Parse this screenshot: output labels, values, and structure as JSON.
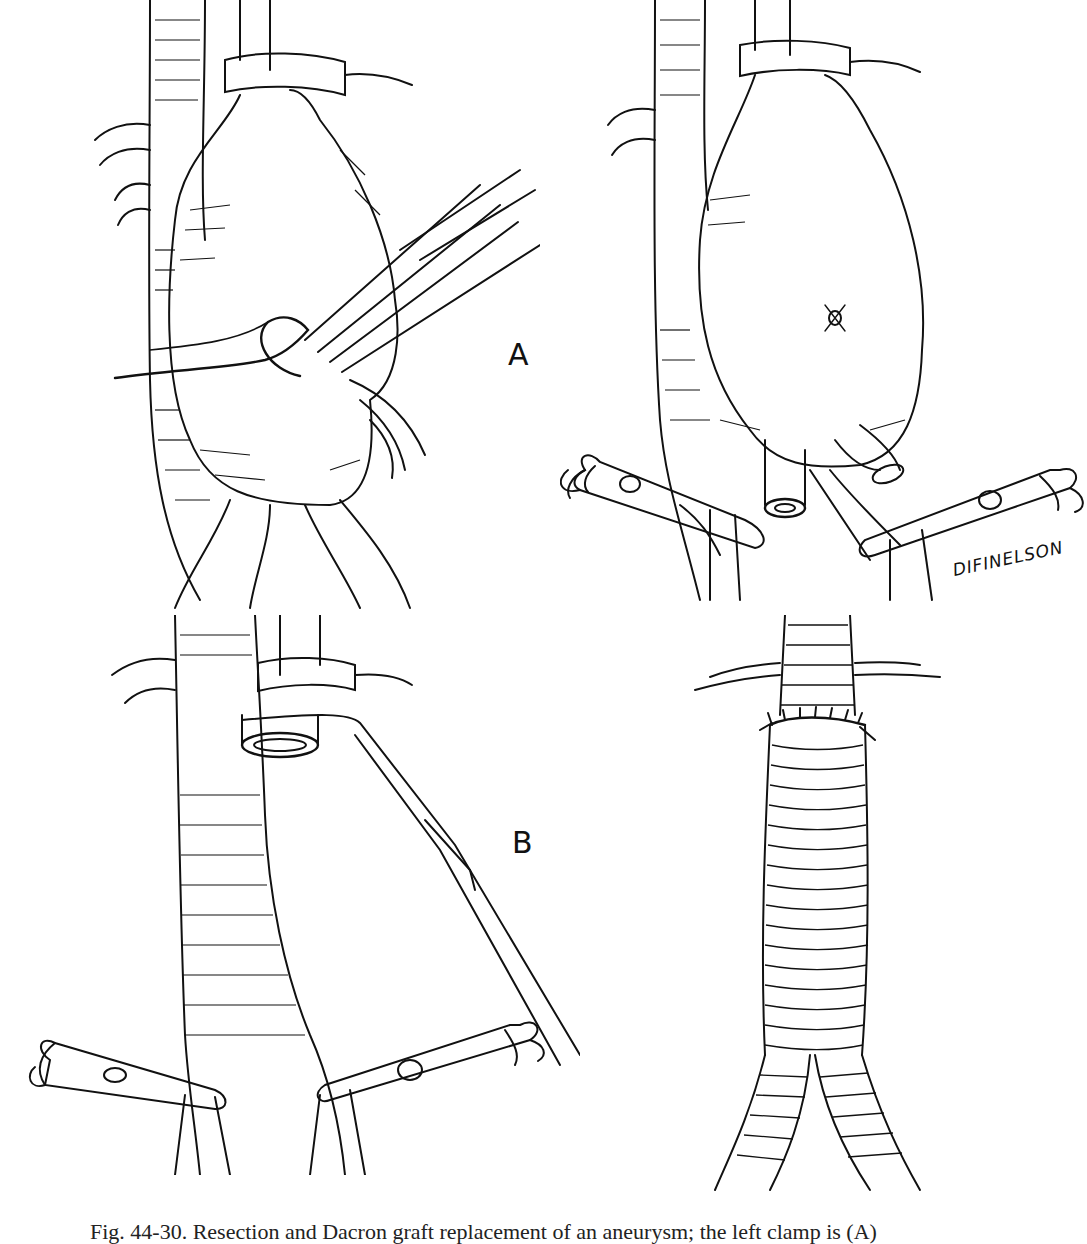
{
  "figure": {
    "ink_color": "#111111",
    "paper_color": "#ffffff",
    "panels": [
      {
        "id": "top-left",
        "title": "Aneurysm with ligature and retracted tissue"
      },
      {
        "id": "top-right",
        "title": "Aneurysm with iliac clamps applied"
      },
      {
        "id": "bottom-left",
        "title": "Aorta cross-clamped, aneurysm excised"
      },
      {
        "id": "bottom-right",
        "title": "Bifurcated woven graft sutured in place"
      }
    ],
    "labels": {
      "a": "A",
      "b": "B"
    },
    "signature": "DIFINELSON"
  },
  "caption": {
    "text": "Fig. 44-30. Resection and Dacron graft replacement of an aneurysm; the left clamp is (A)",
    "truncated": true
  }
}
